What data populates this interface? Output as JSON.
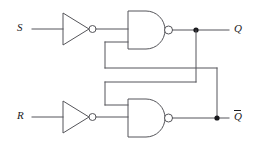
{
  "diagram": {
    "type": "logic-circuit-schematic",
    "background_color": "#ffffff",
    "wire_color": "#55555a",
    "label_color": "#1a1a1c",
    "node_color": "#18181c",
    "inputs": [
      {
        "id": "S",
        "label": "S",
        "overbar": false
      },
      {
        "id": "R",
        "label": "R",
        "overbar": false
      }
    ],
    "outputs": [
      {
        "id": "Q",
        "label": "Q",
        "overbar": false
      },
      {
        "id": "Qbar",
        "label": "Q",
        "overbar": true
      }
    ],
    "gates": [
      {
        "id": "inv-top",
        "type": "inverter",
        "inputs": [
          "S"
        ],
        "outputs": [
          "nS"
        ]
      },
      {
        "id": "inv-bottom",
        "type": "inverter",
        "inputs": [
          "R"
        ],
        "outputs": [
          "nR"
        ]
      },
      {
        "id": "nand-top",
        "type": "nand",
        "inputs": [
          "nS",
          "Qbar"
        ],
        "outputs": [
          "Q"
        ]
      },
      {
        "id": "nand-bottom",
        "type": "nand",
        "inputs": [
          "Q",
          "nR"
        ],
        "outputs": [
          "Qbar"
        ]
      }
    ],
    "junctions": [
      {
        "id": "node-q",
        "on_net": "Q"
      },
      {
        "id": "node-qbar",
        "on_net": "Qbar"
      }
    ],
    "feedback_paths": [
      {
        "from": "Qbar",
        "to": "nand-top.input2"
      },
      {
        "from": "Q",
        "to": "nand-bottom.input1"
      }
    ]
  }
}
